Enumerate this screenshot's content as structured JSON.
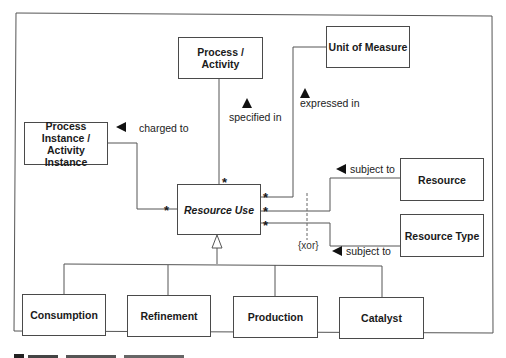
{
  "diagram": {
    "type": "UML class diagram",
    "classes": {
      "process_activity": {
        "label": "Process / Activity"
      },
      "unit_of_measure": {
        "label": "Unit of Measure"
      },
      "process_instance": {
        "label": "Process Instance / Activity Instance"
      },
      "resource_use": {
        "label": "Resource Use",
        "abstract": true
      },
      "resource": {
        "label": "Resource"
      },
      "resource_type": {
        "label": "Resource Type"
      },
      "consumption": {
        "label": "Consumption"
      },
      "refinement": {
        "label": "Refinement"
      },
      "production": {
        "label": "Production"
      },
      "catalyst": {
        "label": "Catalyst"
      }
    },
    "associations": [
      {
        "from": "Resource Use",
        "to": "Process / Activity",
        "label": "specified in",
        "direction": "up",
        "multiplicity": "*"
      },
      {
        "from": "Resource Use",
        "to": "Unit of Measure",
        "label": "expressed in",
        "direction": "up",
        "multiplicity": "*"
      },
      {
        "from": "Resource Use",
        "to": "Process Instance / Activity Instance",
        "label": "charged to",
        "direction": "left",
        "multiplicity": "*"
      },
      {
        "from": "Resource Use",
        "to": "Resource",
        "label": "subject to",
        "direction": "left",
        "multiplicity": "*"
      },
      {
        "from": "Resource Use",
        "to": "Resource Type",
        "label": "subject to",
        "direction": "left",
        "multiplicity": "*"
      }
    ],
    "constraint": {
      "label": "{xor}"
    },
    "generalization": {
      "parent": "Resource Use",
      "children": [
        "Consumption",
        "Refinement",
        "Production",
        "Catalyst"
      ]
    },
    "labels": {
      "specified_in": "specified in",
      "expressed_in": "expressed in",
      "charged_to": "charged to",
      "subject_to_resource": "subject to",
      "subject_to_resource_type": "subject to",
      "xor": "{xor}",
      "multiplicity": "*"
    }
  }
}
